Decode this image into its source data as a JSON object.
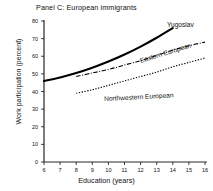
{
  "chart_data": {
    "type": "line",
    "title": "Panel C: European immigrants",
    "xlabel": "Education (years)",
    "ylabel": "Work participation (percent)",
    "xlim": [
      6,
      16
    ],
    "ylim": [
      0,
      80
    ],
    "xticks": [
      6,
      7,
      8,
      9,
      10,
      11,
      12,
      13,
      14,
      15,
      16
    ],
    "yticks": [
      0,
      10,
      20,
      30,
      40,
      50,
      60,
      70,
      80
    ],
    "grid": false,
    "legend_position": "inline-annotations",
    "series": [
      {
        "name": "Yugoslav",
        "style": "solid-thick",
        "x": [
          6,
          7,
          8,
          9,
          10,
          11,
          12,
          13,
          14
        ],
        "values": [
          46.0,
          48.0,
          50.5,
          53.5,
          57.0,
          61.0,
          65.5,
          70.5,
          76.0
        ]
      },
      {
        "name": "Eastern European",
        "style": "dash-dot",
        "x": [
          8,
          9,
          10,
          11,
          12,
          13,
          14,
          15,
          16
        ],
        "values": [
          48.5,
          50.5,
          52.5,
          55.0,
          57.5,
          60.5,
          63.5,
          66.0,
          68.0
        ]
      },
      {
        "name": "Northwestern European",
        "style": "dotted",
        "x": [
          8,
          9,
          10,
          11,
          12,
          13,
          14,
          15,
          16
        ],
        "values": [
          39.0,
          41.0,
          43.5,
          46.0,
          48.5,
          51.0,
          54.0,
          56.5,
          59.0
        ]
      }
    ]
  }
}
